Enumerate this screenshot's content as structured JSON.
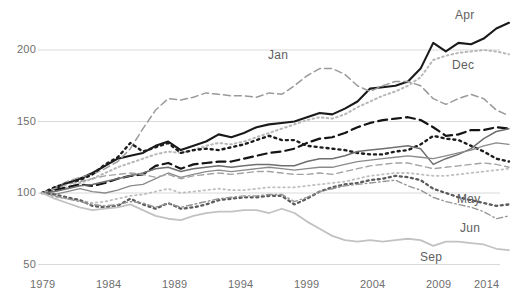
{
  "chart_data": {
    "type": "line",
    "title": "",
    "subtitle": "",
    "xlabel": "",
    "ylabel": "",
    "xlim": [
      1979,
      2016
    ],
    "ylim": [
      50,
      225
    ],
    "grid": true,
    "grid_axis": "y",
    "legend": "inline-right-labels",
    "x_tick_labels": [
      "1979",
      "1984",
      "1989",
      "1994",
      "1999",
      "2004",
      "2009",
      "2014"
    ],
    "x_tick_values": [
      1979,
      1984,
      1989,
      1994,
      1999,
      2004,
      2009,
      2014
    ],
    "y_tick_labels": [
      "50",
      "100",
      "150",
      "200"
    ],
    "y_tick_values": [
      50,
      100,
      150,
      200
    ],
    "x": [
      1979,
      1980,
      1981,
      1982,
      1983,
      1984,
      1985,
      1986,
      1987,
      1988,
      1989,
      1990,
      1991,
      1992,
      1993,
      1994,
      1995,
      1996,
      1997,
      1998,
      1999,
      2000,
      2001,
      2002,
      2003,
      2004,
      2005,
      2006,
      2007,
      2008,
      2009,
      2010,
      2011,
      2012,
      2013,
      2014,
      2015,
      2016
    ],
    "series": [
      {
        "name": "Apr",
        "label": "Apr",
        "style": "solid",
        "color": "#1a1a1a",
        "width": 2.1,
        "label_x": 2015.2,
        "label_y": 223,
        "values": [
          100,
          103,
          107,
          110,
          114,
          119,
          124,
          126,
          128,
          133,
          136,
          130,
          133,
          136,
          141,
          139,
          142,
          146,
          148,
          149,
          150,
          153,
          156,
          155,
          159,
          164,
          173,
          174,
          175,
          178,
          187,
          205,
          199,
          205,
          204,
          208,
          215,
          219
        ]
      },
      {
        "name": "Jan",
        "label": "Jan",
        "style": "dashed",
        "color": "#9a9a9a",
        "width": 1.5,
        "label_x": 1996.5,
        "label_y": 202,
        "values": [
          100,
          104,
          108,
          111,
          113,
          117,
          122,
          131,
          145,
          158,
          166,
          165,
          167,
          170,
          169,
          168,
          168,
          167,
          170,
          169,
          175,
          182,
          187,
          187,
          183,
          175,
          171,
          175,
          178,
          178,
          175,
          166,
          162,
          166,
          169,
          166,
          158,
          154
        ]
      },
      {
        "name": "Dec",
        "label": "Dec",
        "style": "dotted",
        "color": "#b8b8b8",
        "width": 2.0,
        "label_x": 2014.6,
        "label_y": 196,
        "values": [
          100,
          101,
          104,
          107,
          110,
          114,
          118,
          121,
          124,
          127,
          129,
          128,
          130,
          133,
          135,
          134,
          136,
          139,
          142,
          145,
          148,
          151,
          153,
          152,
          155,
          160,
          164,
          168,
          171,
          175,
          181,
          193,
          196,
          198,
          199,
          200,
          199,
          197
        ]
      },
      {
        "name": "Feb",
        "label": "",
        "style": "dashed-long",
        "color": "#141414",
        "width": 2.2,
        "label_x": null,
        "label_y": null,
        "values": [
          100,
          102,
          104,
          106,
          105,
          107,
          110,
          112,
          113,
          119,
          121,
          117,
          120,
          121,
          122,
          122,
          124,
          126,
          128,
          129,
          131,
          135,
          138,
          139,
          142,
          146,
          149,
          151,
          152,
          153,
          151,
          146,
          140,
          141,
          144,
          144,
          146,
          145
        ]
      },
      {
        "name": "Mar",
        "label": "",
        "style": "dotted-bold",
        "color": "#1d1d1d",
        "width": 2.4,
        "label_x": null,
        "label_y": null,
        "values": [
          100,
          104,
          107,
          109,
          113,
          120,
          125,
          135,
          129,
          132,
          135,
          128,
          130,
          131,
          130,
          132,
          134,
          137,
          140,
          137,
          137,
          133,
          132,
          131,
          130,
          128,
          127,
          127,
          129,
          130,
          134,
          140,
          138,
          137,
          133,
          129,
          124,
          122
        ]
      },
      {
        "name": "Jul",
        "label": "",
        "style": "solid-gray",
        "color": "#6f6f6f",
        "width": 1.5,
        "label_x": null,
        "label_y": null,
        "values": [
          100,
          101,
          103,
          105,
          106,
          108,
          110,
          112,
          114,
          117,
          118,
          115,
          117,
          118,
          119,
          118,
          119,
          120,
          120,
          119,
          119,
          122,
          124,
          124,
          126,
          129,
          130,
          131,
          132,
          133,
          131,
          120,
          124,
          127,
          131,
          138,
          143,
          145
        ]
      },
      {
        "name": "Aug",
        "label": "",
        "style": "solid-gray2",
        "color": "#8a8a8a",
        "width": 1.3,
        "label_x": null,
        "label_y": null,
        "values": [
          100,
          99,
          101,
          103,
          101,
          100,
          102,
          105,
          106,
          110,
          114,
          111,
          113,
          115,
          116,
          115,
          116,
          117,
          118,
          117,
          116,
          117,
          118,
          118,
          120,
          122,
          123,
          124,
          125,
          126,
          125,
          124,
          126,
          128,
          130,
          133,
          135,
          134
        ]
      },
      {
        "name": "Oct",
        "label": "",
        "style": "dashed-gray",
        "color": "#a3a3a3",
        "width": 1.4,
        "label_x": null,
        "label_y": null,
        "values": [
          100,
          103,
          106,
          108,
          110,
          112,
          113,
          114,
          113,
          111,
          113,
          110,
          112,
          113,
          114,
          113,
          114,
          115,
          115,
          114,
          113,
          113,
          114,
          113,
          115,
          117,
          119,
          120,
          121,
          121,
          119,
          117,
          118,
          119,
          120,
          121,
          120,
          118
        ]
      },
      {
        "name": "Nov",
        "label": "",
        "style": "dotted-light",
        "color": "#bfbfbf",
        "width": 1.8,
        "label_x": null,
        "label_y": null,
        "values": [
          100,
          97,
          96,
          95,
          93,
          94,
          96,
          98,
          99,
          101,
          103,
          100,
          101,
          102,
          103,
          102,
          102,
          103,
          104,
          104,
          104,
          105,
          106,
          107,
          108,
          110,
          112,
          113,
          114,
          114,
          113,
          112,
          112,
          113,
          114,
          115,
          116,
          117
        ]
      },
      {
        "name": "May",
        "label": "May",
        "style": "dotted-dark",
        "color": "#5c5c5c",
        "width": 2.3,
        "label_x": 2014.8,
        "label_y": 99,
        "values": [
          100,
          99,
          97,
          95,
          91,
          90,
          91,
          96,
          92,
          89,
          93,
          89,
          90,
          92,
          95,
          96,
          97,
          97,
          98,
          98,
          92,
          96,
          101,
          104,
          106,
          107,
          109,
          110,
          112,
          111,
          109,
          103,
          100,
          97,
          95,
          93,
          91,
          92
        ]
      },
      {
        "name": "Jun",
        "label": "Jun",
        "style": "dashdot-gray",
        "color": "#949494",
        "width": 1.4,
        "label_x": 2014.9,
        "label_y": 78,
        "values": [
          100,
          98,
          96,
          94,
          92,
          91,
          92,
          94,
          93,
          90,
          93,
          90,
          92,
          94,
          96,
          97,
          98,
          98,
          99,
          99,
          94,
          97,
          101,
          103,
          105,
          106,
          107,
          108,
          109,
          105,
          102,
          97,
          94,
          92,
          90,
          87,
          82,
          84
        ]
      },
      {
        "name": "Sep",
        "label": "Sep",
        "style": "solid-light",
        "color": "#c2c2c2",
        "width": 1.8,
        "label_x": 2012.6,
        "label_y": 62,
        "values": [
          100,
          96,
          93,
          90,
          88,
          89,
          90,
          92,
          88,
          84,
          82,
          81,
          84,
          86,
          87,
          87,
          88,
          88,
          86,
          89,
          86,
          80,
          75,
          70,
          67,
          66,
          67,
          66,
          67,
          68,
          67,
          63,
          66,
          66,
          65,
          64,
          61,
          60
        ]
      }
    ]
  },
  "labels": {
    "apr": "Apr",
    "jan": "Jan",
    "dec": "Dec",
    "may": "May",
    "jun": "Jun",
    "sep": "Sep"
  },
  "colors": {
    "grid": "#d9d9d9",
    "axis_text": "#6e6e6e",
    "background": "#ffffff"
  }
}
